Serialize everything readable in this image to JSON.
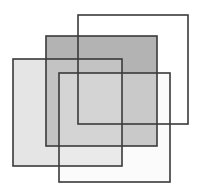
{
  "diagram": {
    "background": "#ffffff",
    "stroke_color": "#3a3a3a",
    "shapes": [
      {
        "id": "square-back-right",
        "fill": "#ffffff",
        "fill_opacity": 0.0,
        "layer": 1
      },
      {
        "id": "square-middle-dark",
        "fill": "#9a9a9a",
        "fill_opacity": 0.75,
        "layer": 2
      },
      {
        "id": "square-left-light",
        "fill": "#cfcfcf",
        "fill_opacity": 0.55,
        "layer": 3
      },
      {
        "id": "square-front-outline",
        "fill": "#f4f4f4",
        "fill_opacity": 0.35,
        "layer": 4
      }
    ]
  }
}
